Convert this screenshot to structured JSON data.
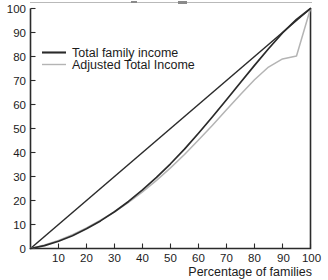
{
  "chart_data": {
    "type": "line",
    "title": "",
    "xlabel": "Percentage of families",
    "ylabel": "",
    "xlim": [
      0,
      100
    ],
    "ylim": [
      0,
      100
    ],
    "grid": false,
    "legend_position": "top-left",
    "x_ticks": [
      10,
      20,
      30,
      40,
      50,
      60,
      70,
      80,
      90,
      100
    ],
    "y_ticks": [
      0,
      10,
      20,
      30,
      40,
      50,
      60,
      70,
      80,
      90,
      100
    ],
    "x_tick_labels": [
      "10",
      "20",
      "30",
      "40",
      "50",
      "60",
      "70",
      "80",
      "90",
      "100"
    ],
    "y_tick_labels": [
      "0",
      "10",
      "20",
      "30",
      "40",
      "50",
      "60",
      "70",
      "80",
      "90",
      "100"
    ],
    "series": [
      {
        "name": "Line of equality",
        "color": "#2a2a2a",
        "style": "solid-thin",
        "show_in_legend": false,
        "x": [
          0,
          100
        ],
        "values": [
          0,
          100
        ]
      },
      {
        "name": "Total family income",
        "color": "#2a2a2a",
        "style": "solid-thick",
        "show_in_legend": true,
        "x": [
          0,
          5,
          10,
          15,
          20,
          25,
          30,
          35,
          40,
          45,
          50,
          55,
          60,
          65,
          70,
          75,
          80,
          85,
          90,
          95,
          100
        ],
        "values": [
          0,
          1.2,
          3.0,
          5.3,
          8.2,
          11.5,
          15.3,
          19.6,
          24.4,
          29.6,
          35.3,
          41.4,
          48.0,
          54.9,
          62.0,
          69.2,
          76.3,
          83.2,
          89.8,
          95.5,
          100
        ]
      },
      {
        "name": "Adjusted Total Income",
        "color": "#b4b4b4",
        "style": "solid-thin",
        "show_in_legend": true,
        "x": [
          0,
          5,
          10,
          15,
          20,
          25,
          30,
          35,
          40,
          45,
          50,
          55,
          60,
          65,
          70,
          75,
          80,
          85,
          90,
          95,
          100
        ],
        "values": [
          0,
          1.5,
          3.4,
          5.8,
          8.6,
          11.8,
          15.3,
          19.2,
          23.6,
          28.4,
          33.6,
          39.2,
          45.2,
          51.4,
          57.8,
          64.2,
          70.3,
          75.6,
          79.0,
          80.2,
          100
        ]
      }
    ],
    "legend_entries": [
      {
        "label": "Total family income",
        "color": "#2a2a2a",
        "weight": "thick"
      },
      {
        "label": "Adjusted Total Income",
        "color": "#b4b4b4",
        "weight": "thin"
      }
    ]
  }
}
